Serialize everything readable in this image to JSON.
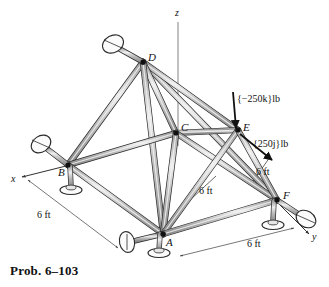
{
  "figure": {
    "caption": "Prob. 6–103",
    "type": "space-truss-free-body-diagram",
    "colors": {
      "member_fill": "#b9b9b9",
      "member_highlight": "#ededed",
      "member_stroke": "#2b2b2b",
      "line": "#1a1a1a",
      "dimension_line": "#555555",
      "axis_line": "#777777",
      "support_fill": "#f2f2f2",
      "text": "#111111",
      "background": "#ffffff"
    },
    "axes": [
      {
        "name": "x",
        "label": "x",
        "label_x": 11,
        "label_y": 182
      },
      {
        "name": "y",
        "label": "y",
        "label_x": 313,
        "label_y": 240
      },
      {
        "name": "z",
        "label": "z",
        "label_x": 177,
        "label_y": 16
      }
    ],
    "nodes": [
      {
        "id": "D",
        "label": "D",
        "x": 143,
        "y": 62,
        "label_x": 148,
        "label_y": 61
      },
      {
        "id": "C",
        "label": "C",
        "x": 176,
        "y": 133,
        "label_x": 181,
        "label_y": 131
      },
      {
        "id": "B",
        "label": "B",
        "x": 68,
        "y": 165,
        "label_x": 64,
        "label_y": 175
      },
      {
        "id": "E",
        "label": "E",
        "x": 238,
        "y": 130,
        "label_x": 243,
        "label_y": 131
      },
      {
        "id": "A",
        "label": "A",
        "x": 163,
        "y": 234,
        "label_x": 167,
        "label_y": 245
      },
      {
        "id": "F",
        "label": "F",
        "x": 277,
        "y": 200,
        "label_x": 283,
        "label_y": 199
      }
    ],
    "members": [
      {
        "from": "D",
        "to": "B"
      },
      {
        "from": "D",
        "to": "C"
      },
      {
        "from": "D",
        "to": "A"
      },
      {
        "from": "D",
        "to": "E"
      },
      {
        "from": "D",
        "to": "F"
      },
      {
        "from": "B",
        "to": "C"
      },
      {
        "from": "B",
        "to": "A"
      },
      {
        "from": "C",
        "to": "A"
      },
      {
        "from": "C",
        "to": "E"
      },
      {
        "from": "C",
        "to": "F"
      },
      {
        "from": "A",
        "to": "E"
      },
      {
        "from": "A",
        "to": "F"
      },
      {
        "from": "E",
        "to": "F"
      }
    ],
    "forces": [
      {
        "name": "vertical-load",
        "label": "{−250k}lb",
        "applied_at": "E",
        "magnitude": 250,
        "unit": "lb",
        "direction": "-k",
        "label_x": 236,
        "label_y": 101,
        "arrow_from_x": 233,
        "arrow_from_y": 92,
        "arrow_to_x": 236,
        "arrow_to_y": 128
      },
      {
        "name": "lateral-load",
        "label": "{250j}lb",
        "applied_at": "E",
        "magnitude": 250,
        "unit": "lb",
        "direction": "+j",
        "label_x": 254,
        "label_y": 146,
        "arrow_from_x": 240,
        "arrow_from_y": 134,
        "arrow_to_x": 272,
        "arrow_to_y": 160
      }
    ],
    "dimensions": [
      {
        "name": "dim-b-a",
        "label": "6 ft",
        "label_x": 38,
        "label_y": 217,
        "from_x": 28,
        "from_y": 180,
        "to_x": 118,
        "to_y": 248
      },
      {
        "name": "dim-c-f",
        "label": "6 ft",
        "label_x": 200,
        "label_y": 193,
        "from_x": 214,
        "from_y": 177,
        "to_x": 186,
        "to_y": 203
      },
      {
        "name": "dim-e-f",
        "label": "6 ft",
        "label_x": 257,
        "label_y": 174,
        "from_x": 268,
        "from_y": 158,
        "to_x": 249,
        "to_y": 185
      },
      {
        "name": "dim-a-f",
        "label": "6 ft",
        "label_x": 250,
        "label_y": 246,
        "from_x": 180,
        "from_y": 256,
        "to_x": 294,
        "to_y": 228
      }
    ],
    "supports": [
      {
        "id": "support-D",
        "at": "D",
        "kind": "angled-rod-disc",
        "disc_x": 116,
        "disc_y": 48
      },
      {
        "id": "support-B-rod",
        "at": "B",
        "kind": "angled-rod-disc",
        "disc_x": 47,
        "disc_y": 145
      },
      {
        "id": "support-B-post",
        "at": "B",
        "kind": "vertical-post-disc",
        "disc_x": 72,
        "disc_y": 192
      },
      {
        "id": "support-A-rod",
        "at": "A",
        "kind": "angled-rod-disc",
        "disc_x": 131,
        "disc_y": 227
      },
      {
        "id": "support-A-post",
        "at": "A",
        "kind": "vertical-post-disc",
        "disc_x": 163,
        "disc_y": 229
      },
      {
        "id": "support-F-rod",
        "at": "F",
        "kind": "angled-rod-disc",
        "disc_x": 297,
        "disc_y": 222
      },
      {
        "id": "support-F-post",
        "at": "F",
        "kind": "vertical-post-disc",
        "disc_x": 273,
        "disc_y": 228
      }
    ]
  }
}
